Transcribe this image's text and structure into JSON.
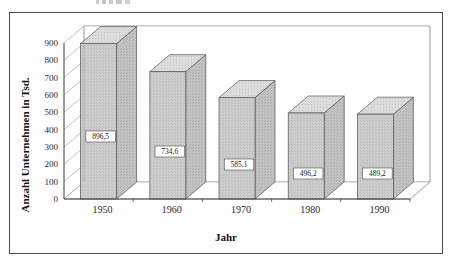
{
  "chart_data": {
    "type": "bar",
    "title": "",
    "xlabel": "Jahr",
    "ylabel": "Anzahl Unternehmen in Tsd.",
    "categories": [
      "1950",
      "1960",
      "1970",
      "1980",
      "1990"
    ],
    "values": [
      896.5,
      734.6,
      585.1,
      496.2,
      489.2
    ],
    "value_labels": [
      "896,5",
      "734,6",
      "585,1",
      "496,2",
      "489,2"
    ],
    "ylim": [
      0,
      900
    ],
    "ytick_labels": [
      "0",
      "100",
      "200",
      "300",
      "400",
      "500",
      "600",
      "700",
      "800",
      "900"
    ],
    "ytick_values": [
      0,
      100,
      200,
      300,
      400,
      500,
      600,
      700,
      800,
      900
    ],
    "grid": true,
    "legend": "none",
    "style": "3d-column",
    "colors": {
      "bar_face": "#c9c9c9",
      "bar_top": "#d8d8d8",
      "bar_side": "#bdbdbd",
      "bar_outline": "#555555",
      "gridline": "#9a9a9a",
      "axis": "#3a3a3a",
      "frame": "#4a4a4a",
      "label_box_fill": "#ffffff",
      "label_box_border": "#4a4a4a",
      "text": "#1b1b1b",
      "background": "#ffffff"
    }
  }
}
